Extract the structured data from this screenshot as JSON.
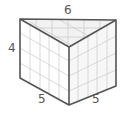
{
  "diagram": {
    "type": "triangular-prism",
    "labels": {
      "top": "6",
      "height": "4",
      "bottom_left": "5",
      "bottom_right": "5"
    },
    "colors": {
      "edge": "#555555",
      "grid": "#c8c8c8",
      "top_face": "#f2f2f2",
      "right_face": "#f7f7f7"
    }
  }
}
